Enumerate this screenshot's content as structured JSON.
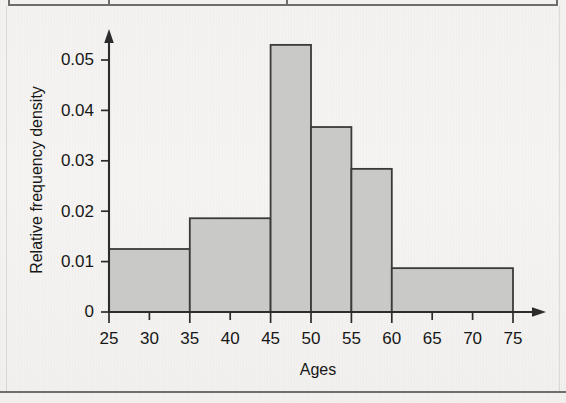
{
  "figure": {
    "kind": "histogram-figure",
    "background_color": "#f4f3f1",
    "bar_fill_color": "#c9c9c7",
    "bar_stroke_color": "#3a3a3a",
    "axis_color": "#2c2c2c"
  },
  "chart_data": {
    "type": "bar",
    "title": "",
    "subtitle": "",
    "xlabel": "Ages",
    "ylabel": "Relative frequency density",
    "grid": false,
    "legend": false,
    "xlim": [
      25,
      78
    ],
    "ylim": [
      0,
      0.0565
    ],
    "x_ticks": [
      25,
      30,
      35,
      40,
      45,
      50,
      55,
      60,
      65,
      70,
      75
    ],
    "x_tick_labels": [
      "25",
      "30",
      "35",
      "40",
      "45",
      "50",
      "55",
      "60",
      "65",
      "70",
      "75"
    ],
    "y_ticks": [
      0,
      0.01,
      0.02,
      0.03,
      0.04,
      0.05
    ],
    "y_tick_labels": [
      "0",
      "0.01",
      "0.02",
      "0.03",
      "0.04",
      "0.05"
    ],
    "bin_edges": [
      25,
      35,
      45,
      50,
      55,
      60,
      75
    ],
    "bins": [
      {
        "label": "25-35",
        "start": 25,
        "end": 35,
        "density": 0.0125
      },
      {
        "label": "35-45",
        "start": 35,
        "end": 45,
        "density": 0.0186
      },
      {
        "label": "45-50",
        "start": 45,
        "end": 50,
        "density": 0.053
      },
      {
        "label": "50-55",
        "start": 50,
        "end": 55,
        "density": 0.0367
      },
      {
        "label": "55-60",
        "start": 55,
        "end": 60,
        "density": 0.0284
      },
      {
        "label": "60-75",
        "start": 60,
        "end": 75,
        "density": 0.0087
      }
    ],
    "categories": [
      "25-35",
      "35-45",
      "45-50",
      "50-55",
      "55-60",
      "60-75"
    ],
    "values": [
      0.0125,
      0.0186,
      0.053,
      0.0367,
      0.0284,
      0.0087
    ]
  }
}
